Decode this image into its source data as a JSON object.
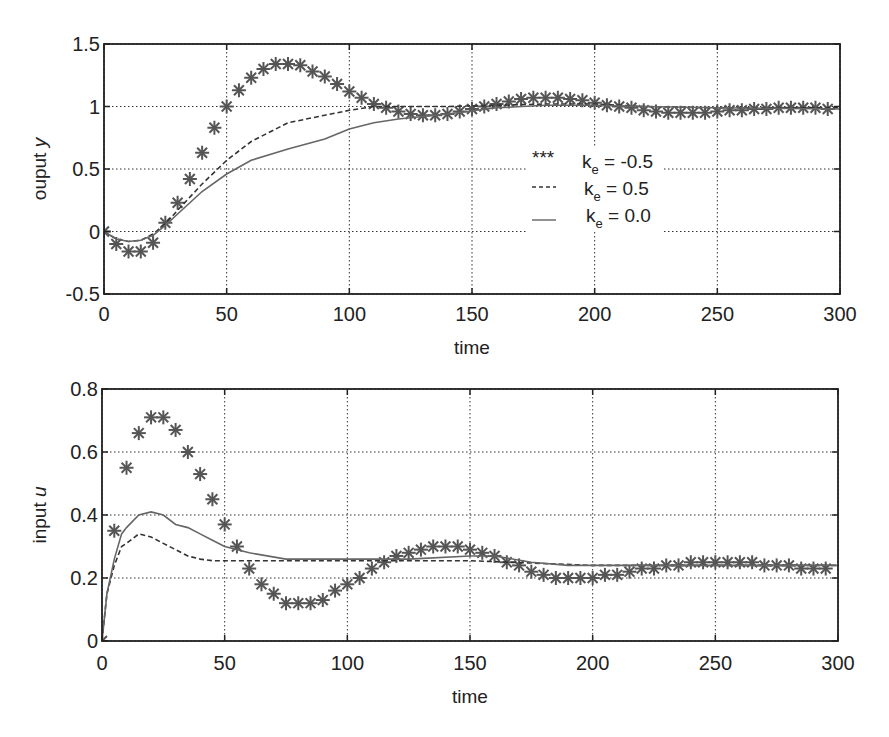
{
  "chart_data": [
    {
      "type": "line",
      "title": "",
      "xlabel": "time",
      "ylabel": "ouput y",
      "xlim": [
        0,
        300
      ],
      "ylim": [
        -0.5,
        1.5
      ],
      "xticks": [
        "0",
        "50",
        "100",
        "150",
        "200",
        "250",
        "300"
      ],
      "yticks": [
        "-0.5",
        "0",
        "0.5",
        "1",
        "1.5"
      ],
      "grid": true,
      "legend": {
        "position": "center-right",
        "entries": [
          {
            "marker": "***",
            "label_main": "k",
            "label_sub": "e",
            "label_rest": " = -0.5"
          },
          {
            "marker": "----",
            "label_main": "k",
            "label_sub": "e",
            "label_rest": " = 0.5"
          },
          {
            "marker": "__",
            "label_main": "k",
            "label_sub": "e",
            "label_rest": " = 0.0"
          }
        ]
      },
      "series": [
        {
          "name": "k_e = -0.5",
          "style": "asterisk-markers",
          "x": [
            0,
            5,
            10,
            15,
            20,
            25,
            30,
            35,
            40,
            45,
            50,
            55,
            60,
            65,
            70,
            75,
            80,
            85,
            90,
            95,
            100,
            105,
            110,
            115,
            120,
            125,
            130,
            135,
            140,
            145,
            150,
            155,
            160,
            165,
            170,
            175,
            180,
            185,
            190,
            195,
            200,
            205,
            210,
            215,
            220,
            225,
            230,
            235,
            240,
            245,
            250,
            255,
            260,
            265,
            270,
            275,
            280,
            285,
            290,
            295
          ],
          "y": [
            0,
            -0.1,
            -0.16,
            -0.16,
            -0.09,
            0.07,
            0.23,
            0.42,
            0.63,
            0.83,
            1.0,
            1.13,
            1.23,
            1.3,
            1.34,
            1.34,
            1.33,
            1.28,
            1.24,
            1.18,
            1.12,
            1.07,
            1.02,
            0.99,
            0.96,
            0.94,
            0.93,
            0.93,
            0.94,
            0.96,
            0.98,
            1.0,
            1.02,
            1.04,
            1.06,
            1.07,
            1.07,
            1.07,
            1.06,
            1.05,
            1.03,
            1.01,
            1.0,
            0.99,
            0.97,
            0.96,
            0.95,
            0.95,
            0.95,
            0.95,
            0.96,
            0.97,
            0.97,
            0.98,
            0.98,
            0.99,
            0.99,
            0.99,
            0.99,
            0.98
          ]
        },
        {
          "name": "k_e = 0.5",
          "style": "dashed",
          "x": [
            0,
            5,
            10,
            15,
            20,
            25,
            30,
            40,
            50,
            60,
            75,
            90,
            100,
            110,
            120,
            140,
            160,
            180,
            200,
            220,
            250,
            300
          ],
          "y": [
            0,
            -0.06,
            -0.08,
            -0.07,
            -0.02,
            0.06,
            0.17,
            0.38,
            0.57,
            0.72,
            0.87,
            0.93,
            0.97,
            1.0,
            1.0,
            1.0,
            1.01,
            1.02,
            1.02,
            1.0,
            0.99,
            0.99
          ]
        },
        {
          "name": "k_e = 0.0",
          "style": "solid",
          "x": [
            0,
            5,
            10,
            15,
            20,
            25,
            30,
            40,
            50,
            60,
            75,
            90,
            100,
            110,
            120,
            140,
            160,
            180,
            200,
            220,
            250,
            300
          ],
          "y": [
            0,
            -0.06,
            -0.08,
            -0.07,
            -0.03,
            0.05,
            0.14,
            0.32,
            0.46,
            0.57,
            0.66,
            0.74,
            0.82,
            0.87,
            0.9,
            0.94,
            0.99,
            1.01,
            1.01,
            1.0,
            0.99,
            0.98
          ]
        }
      ]
    },
    {
      "type": "line",
      "title": "",
      "xlabel": "time",
      "ylabel": "input u",
      "xlim": [
        0,
        300
      ],
      "ylim": [
        0,
        0.8
      ],
      "xticks": [
        "0",
        "50",
        "100",
        "150",
        "200",
        "250",
        "300"
      ],
      "yticks": [
        "0",
        "0.2",
        "0.4",
        "0.6",
        "0.8"
      ],
      "grid": true,
      "series": [
        {
          "name": "k_e = -0.5",
          "style": "asterisk-markers",
          "x": [
            0,
            5,
            10,
            15,
            20,
            25,
            30,
            35,
            40,
            45,
            50,
            55,
            60,
            65,
            70,
            75,
            80,
            85,
            90,
            95,
            100,
            105,
            110,
            115,
            120,
            125,
            130,
            135,
            140,
            145,
            150,
            155,
            160,
            165,
            170,
            175,
            180,
            185,
            190,
            195,
            200,
            205,
            210,
            215,
            220,
            225,
            230,
            235,
            240,
            245,
            250,
            255,
            260,
            265,
            270,
            275,
            280,
            285,
            290,
            295
          ],
          "y": [
            0,
            0.35,
            0.55,
            0.66,
            0.71,
            0.71,
            0.67,
            0.6,
            0.53,
            0.45,
            0.37,
            0.3,
            0.23,
            0.18,
            0.15,
            0.12,
            0.12,
            0.12,
            0.13,
            0.16,
            0.18,
            0.2,
            0.23,
            0.25,
            0.27,
            0.28,
            0.29,
            0.3,
            0.3,
            0.3,
            0.29,
            0.28,
            0.27,
            0.25,
            0.24,
            0.22,
            0.21,
            0.2,
            0.2,
            0.2,
            0.2,
            0.21,
            0.21,
            0.22,
            0.23,
            0.23,
            0.24,
            0.24,
            0.25,
            0.25,
            0.25,
            0.25,
            0.25,
            0.25,
            0.24,
            0.24,
            0.24,
            0.23,
            0.23,
            0.23
          ]
        },
        {
          "name": "k_e = 0.5",
          "style": "dashed",
          "x": [
            0,
            2,
            5,
            8,
            10,
            15,
            20,
            25,
            30,
            35,
            40,
            45,
            50,
            60,
            75,
            100,
            150,
            200,
            250,
            300
          ],
          "y": [
            0,
            0.15,
            0.24,
            0.3,
            0.31,
            0.34,
            0.33,
            0.31,
            0.29,
            0.27,
            0.26,
            0.255,
            0.255,
            0.255,
            0.255,
            0.255,
            0.255,
            0.24,
            0.24,
            0.24
          ]
        },
        {
          "name": "k_e = 0.0",
          "style": "solid",
          "x": [
            0,
            2,
            5,
            8,
            10,
            15,
            20,
            25,
            30,
            35,
            40,
            45,
            50,
            60,
            75,
            100,
            125,
            150,
            160,
            175,
            190,
            200,
            220,
            250,
            300
          ],
          "y": [
            0,
            0.15,
            0.26,
            0.34,
            0.36,
            0.4,
            0.41,
            0.4,
            0.37,
            0.36,
            0.34,
            0.32,
            0.3,
            0.28,
            0.26,
            0.26,
            0.26,
            0.27,
            0.27,
            0.25,
            0.24,
            0.24,
            0.24,
            0.24,
            0.24
          ]
        }
      ]
    }
  ]
}
